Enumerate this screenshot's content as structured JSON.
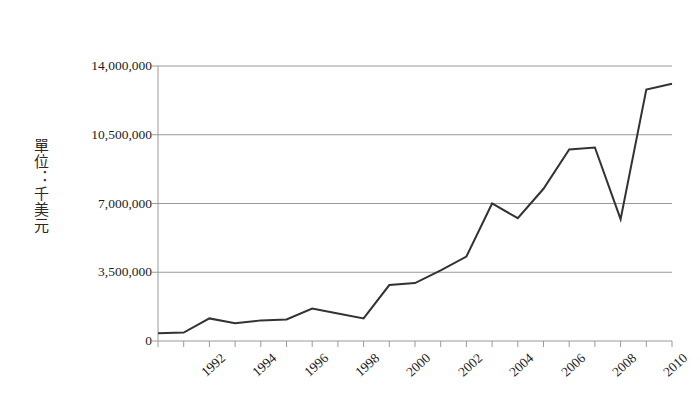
{
  "axis": {
    "y_title": "單位：千美元",
    "y_tick_labels": [
      "14,000,000",
      "10,500,000",
      "7,000,000",
      "3,500,000",
      "0"
    ],
    "x_tick_labels": [
      "1992",
      "1994",
      "1996",
      "1998",
      "2000",
      "2002",
      "2004",
      "2006",
      "2008",
      "2010"
    ]
  },
  "style": {
    "line_color": "#333333",
    "grid_color": "#9a9a9a",
    "axis_color": "#9a9a9a",
    "background": "#ffffff"
  },
  "chart_data": {
    "type": "line",
    "title": "",
    "xlabel": "",
    "ylabel": "單位：千美元",
    "grid": true,
    "legend": false,
    "xlim": [
      1991,
      2011
    ],
    "ylim": [
      0,
      14000000
    ],
    "yticks": [
      0,
      3500000,
      7000000,
      10500000,
      14000000
    ],
    "xticks": [
      1992,
      1994,
      1996,
      1998,
      2000,
      2002,
      2004,
      2006,
      2008,
      2010
    ],
    "x": [
      1991,
      1992,
      1993,
      1994,
      1995,
      1996,
      1997,
      1998,
      1999,
      2000,
      2001,
      2002,
      2003,
      2004,
      2005,
      2006,
      2007,
      2008,
      2009,
      2010,
      2011
    ],
    "series": [
      {
        "name": "金額",
        "values": [
          400000,
          430000,
          1150000,
          900000,
          1050000,
          1100000,
          1650000,
          1400000,
          1150000,
          2850000,
          2950000,
          3600000,
          4300000,
          7000000,
          6250000,
          7750000,
          9750000,
          9850000,
          6200000,
          12800000,
          13100000
        ]
      }
    ]
  }
}
